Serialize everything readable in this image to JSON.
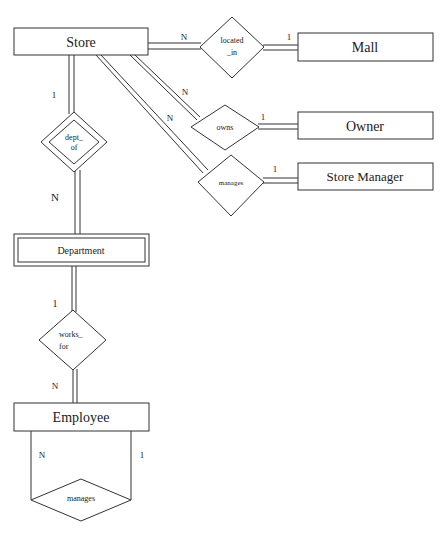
{
  "diagram": {
    "type": "ER diagram",
    "entities": {
      "store": {
        "label": "Store",
        "weak": false
      },
      "mall": {
        "label": "Mall",
        "weak": false
      },
      "owner": {
        "label": "Owner",
        "weak": false
      },
      "store_manager": {
        "label": "Store Manager",
        "weak": false
      },
      "department": {
        "label": "Department",
        "weak": true
      },
      "employee": {
        "label": "Employee",
        "weak": false
      }
    },
    "relationships": {
      "located_in": {
        "line1": "located",
        "line2": "_in",
        "identifying": false
      },
      "owns": {
        "label": "owns",
        "identifying": false
      },
      "manages_store": {
        "label": "manages",
        "identifying": false
      },
      "dept_of": {
        "line1": "dept_",
        "line2": "of",
        "identifying": true
      },
      "works_for": {
        "line1": "works_",
        "line2": "for",
        "identifying": false
      },
      "manages_employee": {
        "label": "manages",
        "identifying": false
      }
    },
    "cardinalities": {
      "store_located_in": "N",
      "mall_located_in": "1",
      "store_owns": "N",
      "owner_owns": "1",
      "store_manages": "N",
      "manager_manages": "1",
      "store_dept_of": "1",
      "department_dept_of": "N",
      "department_works_for": "1",
      "employee_works_for": "N",
      "employee_manages_left": "N",
      "employee_manages_right": "1"
    }
  }
}
